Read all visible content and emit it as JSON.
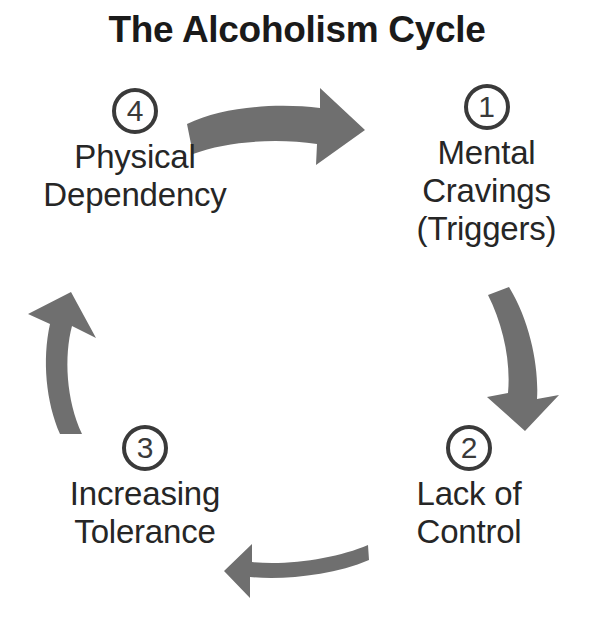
{
  "title": "The Alcoholism Cycle",
  "colors": {
    "arrow_gray": "#6f6f6f",
    "text_dark": "#262626",
    "badge_outline": "#3a3a3a",
    "background": "#ffffff"
  },
  "diagram": {
    "type": "cycle",
    "direction": "clockwise",
    "stage_count": 4,
    "stages": [
      {
        "number": "1",
        "label": "Mental\nCravings\n(Triggers)",
        "position": "top-right"
      },
      {
        "number": "2",
        "label": "Lack of\nControl",
        "position": "bottom-right"
      },
      {
        "number": "3",
        "label": "Increasing\nTolerance",
        "position": "bottom-left"
      },
      {
        "number": "4",
        "label": "Physical\nDependency",
        "position": "top-left"
      }
    ],
    "arrows": [
      {
        "name": "arrow-top",
        "direction": "right",
        "from": "4",
        "to": "1"
      },
      {
        "name": "arrow-right",
        "direction": "down",
        "from": "1",
        "to": "2"
      },
      {
        "name": "arrow-bottom",
        "direction": "left",
        "from": "2",
        "to": "3"
      },
      {
        "name": "arrow-left",
        "direction": "up",
        "from": "3",
        "to": "4"
      }
    ]
  }
}
